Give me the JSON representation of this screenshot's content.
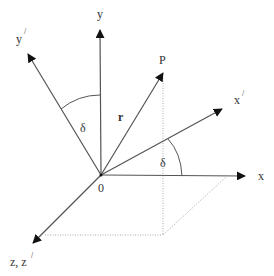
{
  "diagram": {
    "colors": {
      "axis": "#555555",
      "dotted": "#aaaaaa",
      "arrowhead": "#111111",
      "text": "#333333"
    },
    "origin": {
      "label": "0",
      "x": 101,
      "y": 175
    },
    "axes": [
      {
        "id": "x",
        "label": "x",
        "tip": [
          245,
          176
        ],
        "label_pos": [
          260,
          180
        ]
      },
      {
        "id": "y",
        "label": "y",
        "tip": [
          100,
          30
        ],
        "label_pos": [
          100,
          18
        ]
      },
      {
        "id": "x-prime",
        "label": "x",
        "prime": "/",
        "tip": [
          222,
          109
        ],
        "label_pos": [
          238,
          101
        ]
      },
      {
        "id": "y-prime",
        "label": "y",
        "prime": "/",
        "tip": [
          28,
          54
        ],
        "label_pos": [
          18,
          41
        ]
      },
      {
        "id": "z",
        "label": "z, z",
        "prime": "/",
        "tip": [
          33,
          243
        ],
        "label_pos": [
          10,
          266
        ]
      }
    ],
    "vector": {
      "label": "r",
      "point_label": "P",
      "tip": [
        163,
        73
      ],
      "label_pos": [
        119,
        121
      ],
      "point_label_pos": [
        162,
        64
      ]
    },
    "angles": [
      {
        "id": "delta-y",
        "label": "δ",
        "between": [
          "y",
          "y-prime"
        ],
        "label_pos": [
          84,
          131
        ]
      },
      {
        "id": "delta-x",
        "label": "δ",
        "between": [
          "x",
          "x-prime"
        ],
        "label_pos": [
          164,
          166
        ]
      }
    ],
    "projection_lines": [
      {
        "from": [
          163,
          78
        ],
        "to": [
          163,
          235
        ],
        "style": "dotted"
      },
      {
        "from": [
          45,
          235
        ],
        "to": [
          163,
          235
        ],
        "style": "dotted"
      },
      {
        "from": [
          163,
          235
        ],
        "to": [
          226,
          177
        ],
        "style": "dotted"
      }
    ]
  }
}
